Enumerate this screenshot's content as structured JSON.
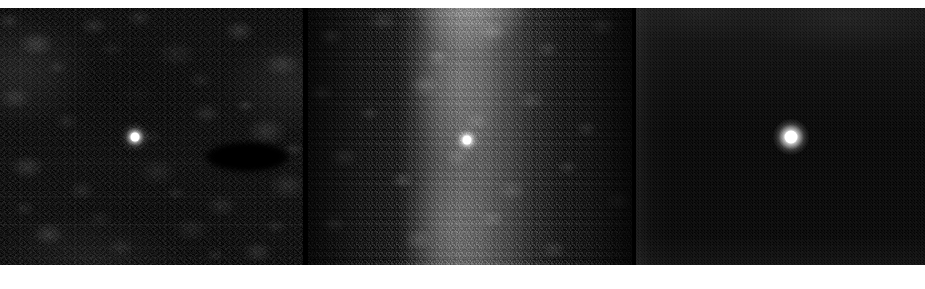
{
  "figure": {
    "width": 925,
    "height": 289,
    "background_color": "#ffffff",
    "panel_count": 3,
    "layout": "horizontal-row"
  },
  "colors": {
    "page_background": "#ffffff",
    "panel_background_dark": "#050505",
    "panel_background_darkest": "#030303",
    "panel_background_mid": "#0a0a0a",
    "gap_color": "#000000",
    "point_source_color": "#ffffff",
    "dark_feature_color": "#000000"
  },
  "panels": [
    {
      "id": "panel-1",
      "label": "left-panel",
      "x": 0,
      "y": 8,
      "width": 303,
      "height": 257,
      "background_description": "mottled coarse-grain dark noise field with a broad darker central region",
      "noise_level": "high-coarse",
      "mean_brightness": 14,
      "features": [
        {
          "name": "point-source",
          "type": "bright-point",
          "x": 135,
          "y": 137,
          "radius": 6,
          "peak_brightness": 255,
          "description": "compact unresolved bright point, faint halo"
        },
        {
          "name": "dark-ellipse",
          "type": "dark-elliptical-region",
          "x": 247,
          "y": 157,
          "width": 84,
          "height": 30,
          "brightness": 0,
          "description": "elongated near-zero-signal elliptical patch right of the point source"
        },
        {
          "name": "dark-central-blob",
          "type": "dark-extended-region",
          "x": 136,
          "y": 77,
          "description": "broad suppressed-signal area in upper-middle of panel"
        }
      ]
    },
    {
      "id": "panel-2",
      "label": "middle-panel",
      "x": 308,
      "y": 8,
      "width": 324,
      "height": 257,
      "background_description": "noisy field dominated by a broad bright vertical band running top to bottom",
      "noise_level": "high-bright",
      "mean_brightness": 46,
      "features": [
        {
          "name": "vertical-band",
          "type": "bright-vertical-stripe",
          "x_center": 472,
          "width": 125,
          "peak_brightness": 150,
          "description": "diffuse vertical band, brightest near the top edge, fading toward panel sides"
        },
        {
          "name": "point-source",
          "type": "bright-point",
          "x": 467,
          "y": 140,
          "radius": 6,
          "peak_brightness": 255,
          "description": "compact bright point embedded within the vertical band"
        }
      ]
    },
    {
      "id": "panel-3",
      "label": "right-panel",
      "x": 636,
      "y": 8,
      "width": 289,
      "height": 257,
      "background_description": "very clean near-black field with only fine-grained low-amplitude noise",
      "noise_level": "low-fine",
      "mean_brightness": 5,
      "features": [
        {
          "name": "point-source",
          "type": "bright-point",
          "x": 791,
          "y": 137,
          "radius": 8,
          "peak_brightness": 255,
          "description": "largest and highest-contrast point source of the three panels"
        }
      ]
    }
  ],
  "gaps": [
    {
      "name": "gap-1",
      "x": 303,
      "width": 5,
      "color": "#000000"
    },
    {
      "name": "gap-2",
      "x": 632,
      "width": 4,
      "color": "#000000"
    }
  ],
  "margins": {
    "top_px": 8,
    "bottom_px": 24,
    "left_px": 0,
    "right_px": 0,
    "color": "#ffffff"
  }
}
